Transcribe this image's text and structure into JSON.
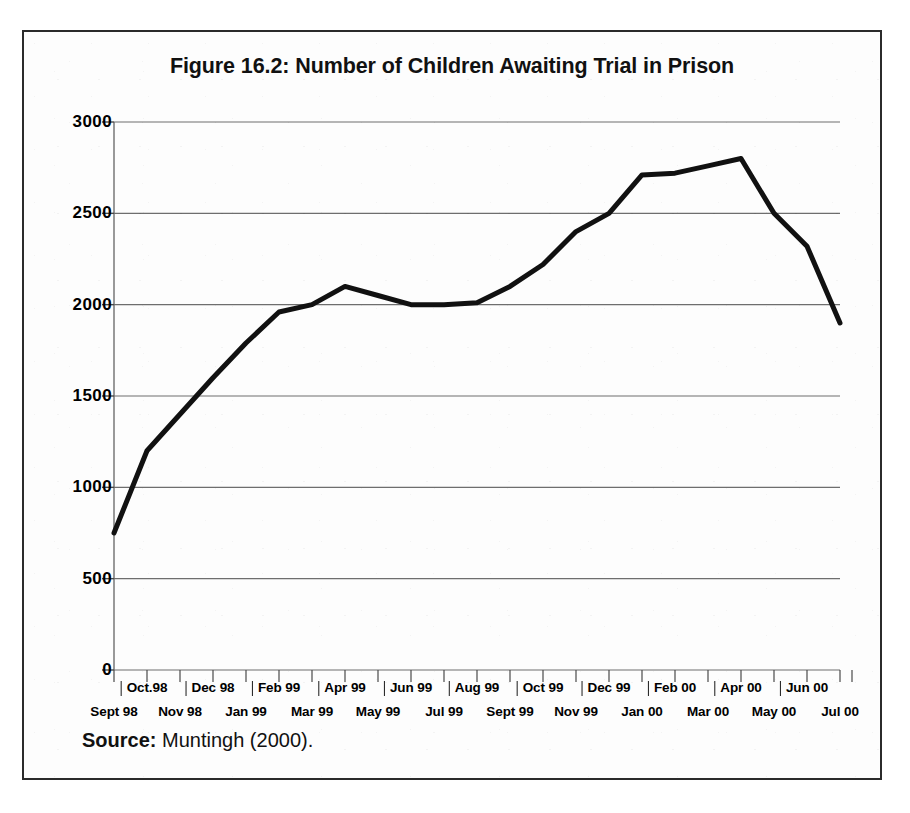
{
  "figure": {
    "title": "Figure 16.2: Number of Children Awaiting Trial in Prison",
    "source_label": "Source:",
    "source_text": " Muntingh (2000)."
  },
  "chart_data": {
    "type": "line",
    "title": "Figure 16.2: Number of Children Awaiting Trial in Prison",
    "xlabel": "",
    "ylabel": "",
    "ylim": [
      0,
      3000
    ],
    "ytick_values": [
      0,
      500,
      1000,
      1500,
      2000,
      2500,
      3000
    ],
    "ytick_labels": [
      "0",
      "500",
      "1000",
      "1500",
      "2000",
      "2500",
      "3000"
    ],
    "grid": true,
    "legend": false,
    "line_color": "#111111",
    "line_width": 5,
    "categories": [
      "Sept 98",
      "Oct.98",
      "Nov 98",
      "Dec 98",
      "Jan 99",
      "Feb 99",
      "Mar 99",
      "Apr 99",
      "May 99",
      "Jun 99",
      "Jul 99",
      "Aug 99",
      "Sept 99",
      "Oct 99",
      "Nov 99",
      "Dec 99",
      "Jan 00",
      "Feb 00",
      "Mar 00",
      "Apr 00",
      "May 00",
      "Jun 00",
      "Jul 00"
    ],
    "xtick_rows": [
      {
        "label": "Sept 98",
        "row": "bottom"
      },
      {
        "label": "Oct.98",
        "row": "top"
      },
      {
        "label": "Nov 98",
        "row": "bottom"
      },
      {
        "label": "Dec 98",
        "row": "top"
      },
      {
        "label": "Jan 99",
        "row": "bottom"
      },
      {
        "label": "Feb 99",
        "row": "top"
      },
      {
        "label": "Mar 99",
        "row": "bottom"
      },
      {
        "label": "Apr 99",
        "row": "top"
      },
      {
        "label": "May 99",
        "row": "bottom"
      },
      {
        "label": "Jun 99",
        "row": "top"
      },
      {
        "label": "Jul 99",
        "row": "bottom"
      },
      {
        "label": "Aug 99",
        "row": "top"
      },
      {
        "label": "Sept 99",
        "row": "bottom"
      },
      {
        "label": "Oct 99",
        "row": "top"
      },
      {
        "label": "Nov 99",
        "row": "bottom"
      },
      {
        "label": "Dec 99",
        "row": "top"
      },
      {
        "label": "Jan 00",
        "row": "bottom"
      },
      {
        "label": "Feb 00",
        "row": "top"
      },
      {
        "label": "Mar 00",
        "row": "bottom"
      },
      {
        "label": "Apr 00",
        "row": "top"
      },
      {
        "label": "May 00",
        "row": "bottom"
      },
      {
        "label": "Jun 00",
        "row": "top"
      },
      {
        "label": "Jul 00",
        "row": "bottom"
      }
    ],
    "values": [
      750,
      1200,
      1400,
      1600,
      1790,
      1960,
      2000,
      2100,
      2050,
      2000,
      2000,
      2010,
      2100,
      2220,
      2400,
      2500,
      2710,
      2720,
      2760,
      2800,
      2500,
      2320,
      1900
    ]
  }
}
